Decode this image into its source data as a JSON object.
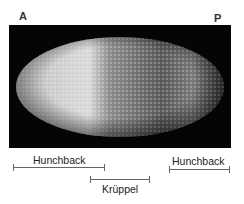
{
  "figure": {
    "anterior_label": "A",
    "posterior_label": "P",
    "image_description": "Fluorescent Drosophila embryo, anterior bright, posterior dim",
    "domains": [
      {
        "gene": "Hunchback",
        "region": "anterior",
        "label": "Hunchback"
      },
      {
        "gene": "Krüppel",
        "region": "central",
        "label": "Krüppel"
      },
      {
        "gene": "Hunchback",
        "region": "posterior",
        "label": "Hunchback"
      }
    ],
    "colors": {
      "background": "#050505",
      "bright": "#e8e8e8",
      "bar": "#666666"
    }
  }
}
